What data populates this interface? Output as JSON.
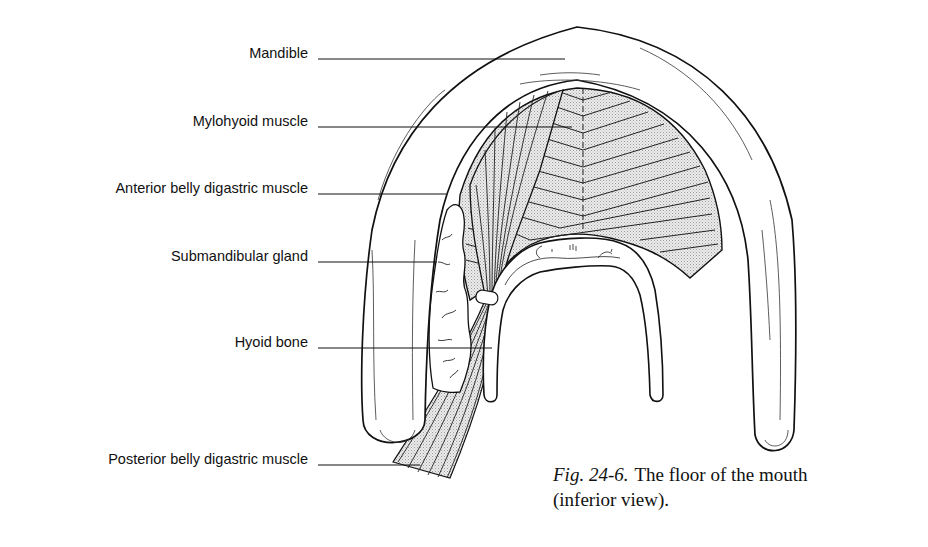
{
  "figure": {
    "title": "The floor of the mouth (inferior view)",
    "labels": [
      {
        "id": "mandible",
        "text": "Mandible"
      },
      {
        "id": "mylohyoid",
        "text": "Mylohyoid muscle"
      },
      {
        "id": "anterior-digastric",
        "text": "Anterior belly digastric muscle"
      },
      {
        "id": "submandibular",
        "text": "Submandibular gland"
      },
      {
        "id": "hyoid",
        "text": "Hyoid bone"
      },
      {
        "id": "posterior-digastric",
        "text": "Posterior belly digastric muscle"
      }
    ],
    "caption": {
      "fig_number": "Fig. 24-6.",
      "line1": "The floor of the mouth",
      "line2": "(inferior view)."
    }
  },
  "colors": {
    "ink": "#111111",
    "muscle_fill": "#e2e2e2",
    "background": "#ffffff"
  }
}
